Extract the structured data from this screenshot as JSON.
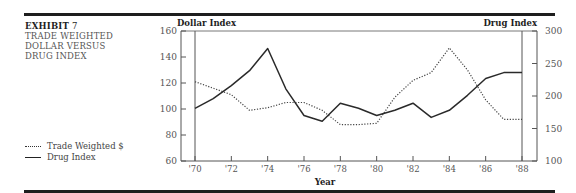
{
  "exhibit": {
    "label": "EXHIBIT",
    "number": "7",
    "title_lines": [
      "TRADE WEIGHTED",
      "DOLLAR VERSUS",
      "DRUG INDEX"
    ]
  },
  "legend": [
    {
      "label": "Trade Weighted $",
      "style": "dotted"
    },
    {
      "label": "Drug Index",
      "style": "solid"
    }
  ],
  "chart_data": {
    "type": "line",
    "xlabel": "Year",
    "ylabel_left": "Dollar Index",
    "ylabel_right": "Drug Index",
    "x": [
      1970,
      1971,
      1972,
      1973,
      1974,
      1975,
      1976,
      1977,
      1978,
      1979,
      1980,
      1981,
      1982,
      1983,
      1984,
      1985,
      1986,
      1987,
      1988
    ],
    "x_tick_labels": [
      "'70",
      "'72",
      "'74",
      "'76",
      "'78",
      "'80",
      "'82",
      "'84",
      "'86",
      "'88"
    ],
    "y_left_ticks": [
      60,
      80,
      100,
      120,
      140,
      160
    ],
    "y_right_ticks": [
      100,
      150,
      200,
      250,
      300
    ],
    "ylim_left": [
      60,
      160
    ],
    "ylim_right": [
      100,
      300
    ],
    "grid": false,
    "legend_position": "left, outside plot",
    "series": [
      {
        "name": "Trade Weighted $",
        "axis": "left",
        "style": "dotted",
        "values": [
          121,
          116,
          111,
          99,
          101,
          105,
          105,
          99,
          88,
          88,
          89,
          109,
          122,
          128,
          147,
          130,
          107,
          92,
          92
        ]
      },
      {
        "name": "Drug Index",
        "axis": "right",
        "style": "solid",
        "values": [
          181,
          196,
          216,
          239,
          273,
          211,
          170,
          161,
          189,
          181,
          170,
          178,
          189,
          167,
          178,
          201,
          227,
          236,
          236
        ]
      }
    ]
  }
}
